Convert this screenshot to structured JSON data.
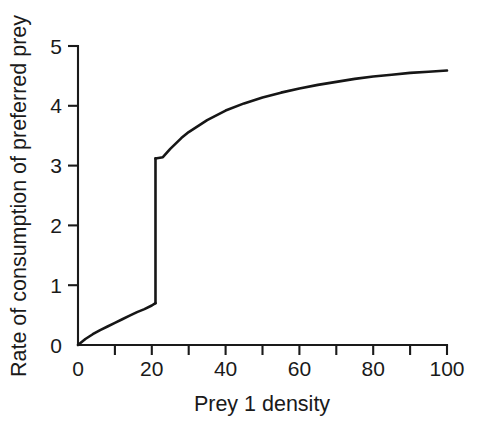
{
  "chart_data": {
    "type": "line",
    "title": "",
    "subtitle": "",
    "xlabel": "Prey 1 density",
    "ylabel": "Rate of consumption of preferred prey",
    "xlim": [
      0,
      100
    ],
    "ylim": [
      0,
      5
    ],
    "grid": false,
    "legend": null,
    "annotations": [],
    "x_ticks_major": [
      0,
      20,
      40,
      60,
      80,
      100
    ],
    "x_tick_labels": [
      "0",
      "20",
      "40",
      "60",
      "80",
      "100"
    ],
    "x_ticks_minor": [
      10,
      30,
      50,
      70,
      90
    ],
    "y_ticks_major": [
      0,
      1,
      2,
      3,
      4,
      5
    ],
    "y_tick_labels": [
      "0",
      "1",
      "2",
      "3",
      "4",
      "5"
    ],
    "y_ticks_minor": [],
    "discontinuity": {
      "x": 21,
      "y_lower": 0.7,
      "y_upper": 3.12,
      "description": "vertical jump in consumption rate at prey 1 density of about 21"
    },
    "series": [
      {
        "name": "Rate of consumption of preferred prey",
        "color": "#161616",
        "segment_lower": [
          {
            "x": 0,
            "y": 0.0
          },
          {
            "x": 2,
            "y": 0.1
          },
          {
            "x": 4,
            "y": 0.18
          },
          {
            "x": 6,
            "y": 0.25
          },
          {
            "x": 8,
            "y": 0.31
          },
          {
            "x": 10,
            "y": 0.37
          },
          {
            "x": 12,
            "y": 0.43
          },
          {
            "x": 14,
            "y": 0.49
          },
          {
            "x": 16,
            "y": 0.55
          },
          {
            "x": 18,
            "y": 0.6
          },
          {
            "x": 20,
            "y": 0.66
          },
          {
            "x": 21,
            "y": 0.7
          }
        ],
        "segment_upper": [
          {
            "x": 21,
            "y": 3.12
          },
          {
            "x": 23,
            "y": 3.14
          },
          {
            "x": 25,
            "y": 3.28
          },
          {
            "x": 28,
            "y": 3.46
          },
          {
            "x": 30,
            "y": 3.56
          },
          {
            "x": 35,
            "y": 3.76
          },
          {
            "x": 40,
            "y": 3.92
          },
          {
            "x": 45,
            "y": 4.04
          },
          {
            "x": 50,
            "y": 4.14
          },
          {
            "x": 55,
            "y": 4.22
          },
          {
            "x": 60,
            "y": 4.29
          },
          {
            "x": 65,
            "y": 4.35
          },
          {
            "x": 70,
            "y": 4.4
          },
          {
            "x": 75,
            "y": 4.45
          },
          {
            "x": 80,
            "y": 4.49
          },
          {
            "x": 85,
            "y": 4.52
          },
          {
            "x": 90,
            "y": 4.55
          },
          {
            "x": 95,
            "y": 4.57
          },
          {
            "x": 100,
            "y": 4.59
          }
        ]
      }
    ]
  },
  "plot_geometry": {
    "x_px_min": 78,
    "x_px_max": 447,
    "y_px_min": 345,
    "y_px_max": 46,
    "tick_len_major": 10,
    "tick_len_minor": 10
  },
  "colors": {
    "background": "#ffffff",
    "ink": "#1a1a1a",
    "curve": "#161616"
  }
}
